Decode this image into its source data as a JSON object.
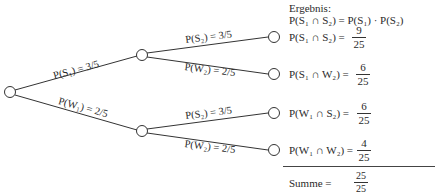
{
  "header": {
    "title": "Ergebnis:",
    "formula": "P(S₁ ∩ S₂) = P(S₁) · P(S₂)"
  },
  "branches": {
    "level1": [
      {
        "label": "P(S₁) = 3/5",
        "event": "S1",
        "probability": "3/5"
      },
      {
        "label": "P(W₁) = 2/5",
        "event": "W1",
        "probability": "2/5"
      }
    ],
    "level2": [
      {
        "label": "P(S₂) = 3/5",
        "parent": "S1",
        "event": "S2",
        "probability": "3/5"
      },
      {
        "label": "P(W₂) = 2/5",
        "parent": "S1",
        "event": "W2",
        "probability": "2/5"
      },
      {
        "label": "P(S₂) = 3/5",
        "parent": "W1",
        "event": "S2",
        "probability": "3/5"
      },
      {
        "label": "P(W₂) = 2/5",
        "parent": "W1",
        "event": "W2",
        "probability": "2/5"
      }
    ]
  },
  "results": [
    {
      "label": "P(S₁ ∩ S₂) =",
      "num": "9",
      "den": "25"
    },
    {
      "label": "P(S₁ ∩ W₂) =",
      "num": "6",
      "den": "25"
    },
    {
      "label": "P(W₁ ∩ S₂) =",
      "num": "6",
      "den": "25"
    },
    {
      "label": "P(W₁ ∩ W₂) =",
      "num": "4",
      "den": "25"
    }
  ],
  "sum": {
    "label": "Summe =",
    "num": "25",
    "den": "25"
  },
  "colors": {
    "line": "#333333",
    "text": "#2a2a2a",
    "background": "#ffffff"
  }
}
